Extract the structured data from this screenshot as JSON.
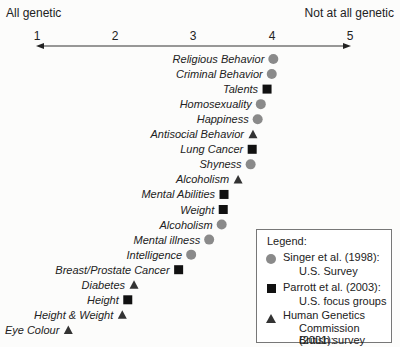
{
  "chart_data": {
    "type": "scatter",
    "title": "",
    "axis": {
      "min": 1,
      "max": 5,
      "ticks": [
        1,
        2,
        3,
        4,
        5
      ],
      "left_label": "All genetic",
      "right_label": "Not at all genetic"
    },
    "marker_colors": {
      "circle": "#8a8a8a",
      "square": "#111111",
      "triangle": "#333333"
    },
    "points": [
      {
        "label": "Religious Behavior",
        "value": 4.02,
        "series": "circle"
      },
      {
        "label": "Criminal Behavior",
        "value": 4.0,
        "series": "circle"
      },
      {
        "label": "Talents",
        "value": 3.94,
        "series": "square"
      },
      {
        "label": "Homosexuality",
        "value": 3.86,
        "series": "circle"
      },
      {
        "label": "Happiness",
        "value": 3.82,
        "series": "circle"
      },
      {
        "label": "Antisocial Behavior",
        "value": 3.76,
        "series": "triangle"
      },
      {
        "label": "Lung Cancer",
        "value": 3.75,
        "series": "square"
      },
      {
        "label": "Shyness",
        "value": 3.73,
        "series": "circle"
      },
      {
        "label": "Alcoholism",
        "value": 3.57,
        "series": "triangle"
      },
      {
        "label": "Mental Abilities",
        "value": 3.39,
        "series": "square"
      },
      {
        "label": "Weight",
        "value": 3.38,
        "series": "square"
      },
      {
        "label": "Alcoholism",
        "value": 3.36,
        "series": "circle"
      },
      {
        "label": "Mental illness",
        "value": 3.2,
        "series": "circle"
      },
      {
        "label": "Intelligence",
        "value": 2.97,
        "series": "circle"
      },
      {
        "label": "Breast/Prostate Cancer",
        "value": 2.81,
        "series": "square"
      },
      {
        "label": "Diabetes",
        "value": 2.24,
        "series": "triangle"
      },
      {
        "label": "Height",
        "value": 2.16,
        "series": "square"
      },
      {
        "label": "Height & Weight",
        "value": 2.09,
        "series": "triangle"
      },
      {
        "label": "Eye Colour",
        "value": 1.4,
        "series": "triangle"
      }
    ],
    "legend": {
      "title": "Legend:",
      "entries": [
        {
          "series": "circle",
          "line1": "Singer et al. (1998):",
          "line2": "U.S. Survey",
          "line3": ""
        },
        {
          "series": "square",
          "line1": "Parrott et al. (2003):",
          "line2": "U.S. focus groups",
          "line3": ""
        },
        {
          "series": "triangle",
          "line1": "Human Genetics",
          "line2": "Commission (2001):",
          "line3": "British survey"
        }
      ]
    }
  }
}
